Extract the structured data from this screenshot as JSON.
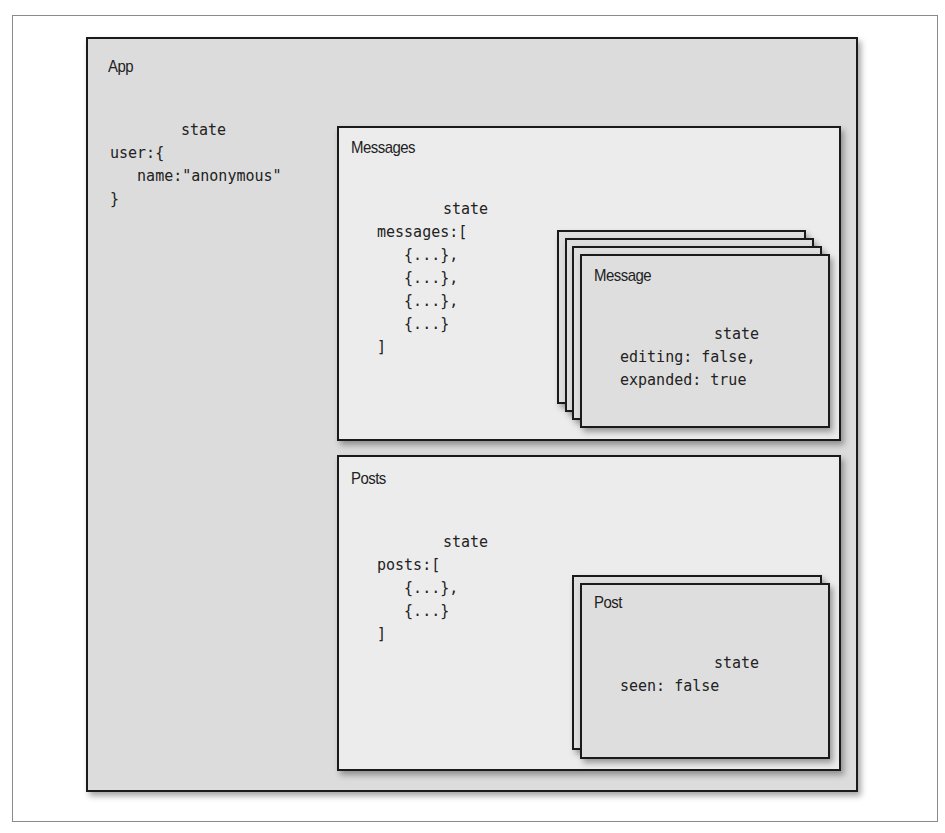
{
  "diagram": {
    "app": {
      "title": "App",
      "state_label": "state",
      "state_code": "user:{\n   name:\"anonymous\"\n}"
    },
    "messages": {
      "title": "Messages",
      "state_label": "state",
      "state_code": "messages:[\n   {...},\n   {...},\n   {...},\n   {...}\n]",
      "item": {
        "title": "Message",
        "stack_count": 4,
        "state_label": "state",
        "state_code": "editing: false,\nexpanded: true"
      }
    },
    "posts": {
      "title": "Posts",
      "state_label": "state",
      "state_code": "posts:[\n   {...},\n   {...}\n]",
      "item": {
        "title": "Post",
        "stack_count": 2,
        "state_label": "state",
        "state_code": "seen: false"
      }
    }
  },
  "colors": {
    "border": "#1a1a1a",
    "app_fill": "#dcdcdc",
    "panel_fill": "#ececec",
    "card_fill": "#dedede"
  }
}
